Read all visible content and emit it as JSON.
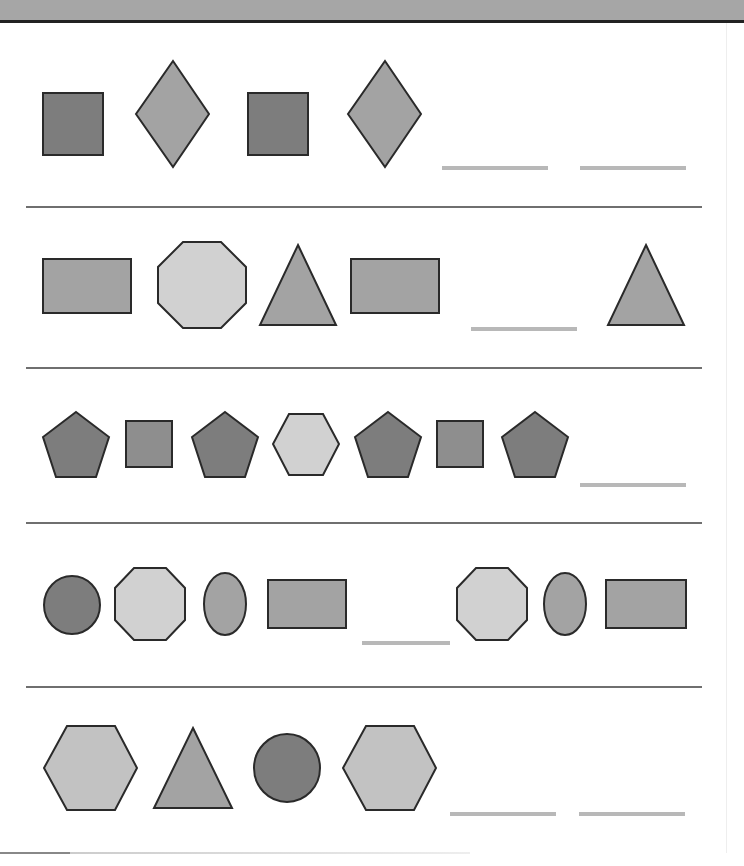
{
  "worksheet": {
    "header_text": "",
    "colors": {
      "dark": "#7d7d7d",
      "medium": "#a3a3a3",
      "light": "#d1d1d1",
      "blank_line": "#b8b8b8",
      "divider": "#6f6f6f",
      "header_bg": "#a6a6a6"
    },
    "rows": [
      {
        "items": [
          "dark square",
          "medium diamond",
          "dark square",
          "medium diamond",
          "blank",
          "blank"
        ]
      },
      {
        "items": [
          "medium rectangle",
          "light octagon",
          "medium triangle",
          "medium rectangle",
          "blank",
          "medium triangle"
        ]
      },
      {
        "items": [
          "dark pentagon",
          "medium square",
          "dark pentagon",
          "light hexagon",
          "dark pentagon",
          "medium square",
          "dark pentagon",
          "blank"
        ]
      },
      {
        "items": [
          "dark circle",
          "light octagon",
          "medium oval",
          "medium rectangle",
          "blank",
          "light octagon",
          "medium oval",
          "medium rectangle"
        ]
      },
      {
        "items": [
          "light hexagon",
          "medium triangle",
          "dark circle",
          "light hexagon",
          "blank",
          "blank"
        ]
      }
    ]
  }
}
